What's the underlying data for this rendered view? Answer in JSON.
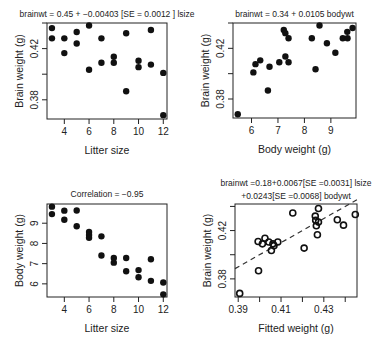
{
  "chart_data": [
    {
      "type": "scatter",
      "title": "brainwt = 0.45 + −0.00403 [SE = 0.0012 ] lsize",
      "xlabel": "Litter size",
      "ylabel": "Brain weight (g)",
      "xticks": [
        4,
        6,
        8,
        10,
        12
      ],
      "yticks": [
        0.38,
        0.42
      ],
      "ytick_marks": [
        0.38,
        0.4,
        0.42,
        0.44
      ],
      "xlim": [
        2.6,
        12.3
      ],
      "ylim": [
        0.365,
        0.44
      ],
      "marker": "filled",
      "points": [
        [
          3,
          0.436
        ],
        [
          3,
          0.428
        ],
        [
          4,
          0.428
        ],
        [
          4,
          0.4165
        ],
        [
          5,
          0.433
        ],
        [
          5,
          0.424
        ],
        [
          6,
          0.438
        ],
        [
          6,
          0.4035
        ],
        [
          7,
          0.428
        ],
        [
          7,
          0.409
        ],
        [
          8,
          0.4136
        ],
        [
          8,
          0.409
        ],
        [
          9,
          0.432
        ],
        [
          9,
          0.3867
        ],
        [
          10,
          0.4105
        ],
        [
          10,
          0.4055
        ],
        [
          11,
          0.4345
        ],
        [
          11,
          0.4075
        ],
        [
          12,
          0.401
        ],
        [
          12,
          0.368
        ]
      ]
    },
    {
      "type": "scatter",
      "title": "brainwt = 0.34 + 0.0105 bodywt",
      "xlabel": "Body weight (g)",
      "ylabel": "Brain weight (g)",
      "xticks": [
        6,
        7,
        8,
        9
      ],
      "yticks": [
        0.38,
        0.42
      ],
      "ytick_marks": [
        0.38,
        0.4,
        0.42,
        0.44
      ],
      "xlim": [
        5.3,
        9.95
      ],
      "ylim": [
        0.365,
        0.44
      ],
      "marker": "filled",
      "points": [
        [
          5.48,
          0.368
        ],
        [
          6.07,
          0.401
        ],
        [
          6.15,
          0.4075
        ],
        [
          6.33,
          0.4105
        ],
        [
          6.62,
          0.3867
        ],
        [
          6.68,
          0.4055
        ],
        [
          7.05,
          0.409
        ],
        [
          7.22,
          0.4345
        ],
        [
          7.28,
          0.4136
        ],
        [
          7.28,
          0.432
        ],
        [
          7.4,
          0.409
        ],
        [
          7.4,
          0.428
        ],
        [
          8.28,
          0.428
        ],
        [
          8.42,
          0.4035
        ],
        [
          8.57,
          0.438
        ],
        [
          8.85,
          0.424
        ],
        [
          9.17,
          0.4165
        ],
        [
          9.45,
          0.428
        ],
        [
          9.62,
          0.433
        ],
        [
          9.63,
          0.428
        ],
        [
          9.82,
          0.436
        ]
      ]
    },
    {
      "type": "scatter",
      "title": "Correlation = −0.95",
      "xlabel": "Litter size",
      "ylabel": "Body weight (g)",
      "xticks": [
        4,
        6,
        8,
        10,
        12
      ],
      "yticks": [
        6,
        7,
        8,
        9
      ],
      "xlim": [
        2.6,
        12.3
      ],
      "ylim": [
        5.35,
        9.95
      ],
      "marker": "filled",
      "points": [
        [
          3,
          9.82
        ],
        [
          3,
          9.45
        ],
        [
          4,
          9.62
        ],
        [
          4,
          9.17
        ],
        [
          5,
          9.63
        ],
        [
          5,
          8.85
        ],
        [
          6,
          8.57
        ],
        [
          6,
          8.42
        ],
        [
          6,
          8.28
        ],
        [
          7,
          8.35
        ],
        [
          7,
          7.4
        ],
        [
          8,
          7.28
        ],
        [
          8,
          7.05
        ],
        [
          9,
          7.28
        ],
        [
          9,
          6.62
        ],
        [
          10,
          6.68
        ],
        [
          10,
          6.33
        ],
        [
          11,
          7.22
        ],
        [
          11,
          6.15
        ],
        [
          12,
          6.07
        ],
        [
          12,
          5.48
        ]
      ]
    },
    {
      "type": "scatter",
      "title": "brainwt =0.18+0.0067[SE =0.0031] lsize",
      "subtitle": "+0.0243[SE =0.0068] bodywt",
      "xlabel": "Fitted weight (g)",
      "ylabel": "Brain weight (g)",
      "xticks": [
        0.39,
        0.41,
        0.43
      ],
      "xtick_marks": [
        0.39,
        0.4,
        0.41,
        0.42,
        0.43,
        0.44
      ],
      "yticks": [
        0.38,
        0.42
      ],
      "ytick_marks": [
        0.38,
        0.4,
        0.42,
        0.44
      ],
      "xlim": [
        0.3885,
        0.4455
      ],
      "ylim": [
        0.365,
        0.442
      ],
      "marker": "open",
      "reference_line": {
        "style": "dashed",
        "slope": 1,
        "intercept": 0
      },
      "points": [
        [
          0.3907,
          0.368
        ],
        [
          0.3995,
          0.3867
        ],
        [
          0.3993,
          0.411
        ],
        [
          0.4013,
          0.409
        ],
        [
          0.4025,
          0.4136
        ],
        [
          0.4043,
          0.4105
        ],
        [
          0.4055,
          0.4035
        ],
        [
          0.4067,
          0.4075
        ],
        [
          0.4062,
          0.409
        ],
        [
          0.4085,
          0.4105
        ],
        [
          0.4155,
          0.4345
        ],
        [
          0.4208,
          0.4055
        ],
        [
          0.426,
          0.432
        ],
        [
          0.4262,
          0.4285
        ],
        [
          0.4265,
          0.424
        ],
        [
          0.4275,
          0.4383
        ],
        [
          0.4275,
          0.427
        ],
        [
          0.427,
          0.4165
        ],
        [
          0.4363,
          0.429
        ],
        [
          0.4392,
          0.4245
        ],
        [
          0.4447,
          0.4333
        ]
      ]
    }
  ]
}
